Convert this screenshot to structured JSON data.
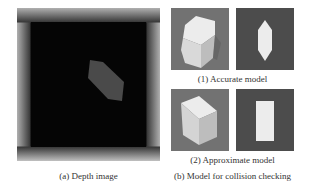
{
  "figure": {
    "panel_a": {
      "caption": "(a) Depth image",
      "object_color": "#4a4a4a",
      "background_color": "#0a0a0a"
    },
    "panel_b": {
      "caption": "(b) Model for collision checking",
      "accurate": {
        "caption": "(1) Accurate model",
        "render_desc": "hexagonal prism",
        "silhouette_desc": "elongated hexagon"
      },
      "approximate": {
        "caption": "(2) Approximate model",
        "render_desc": "cuboid",
        "silhouette_desc": "rectangle"
      },
      "render_bg_color": "#707070",
      "silhouette_bg_color": "#4a4a4a",
      "shape_color": "#e8e8e8"
    }
  }
}
